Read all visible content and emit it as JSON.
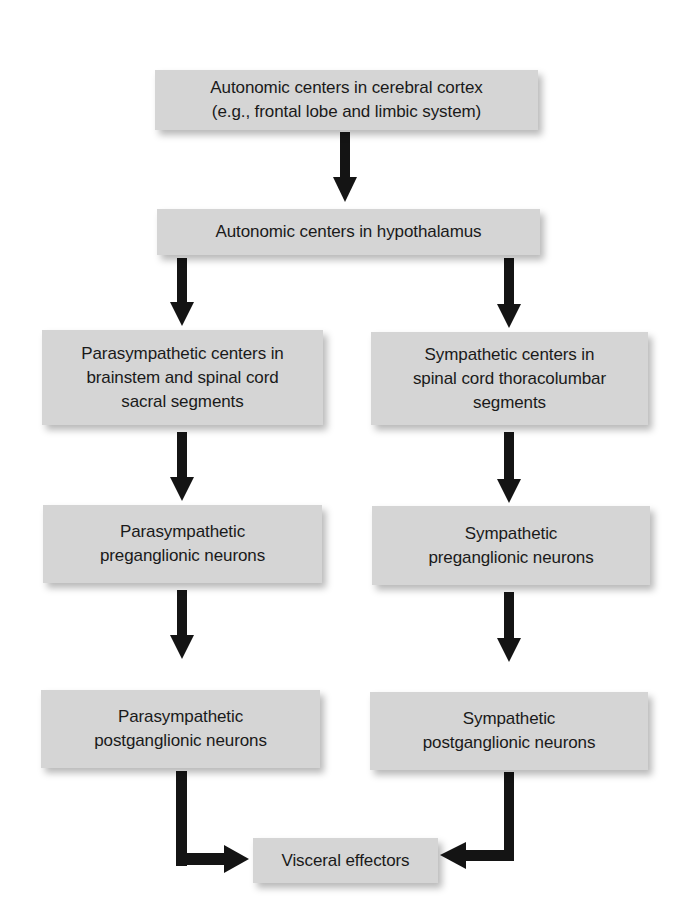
{
  "diagram": {
    "type": "flowchart",
    "title": "",
    "colors": {
      "box_fill": "#d5d5d5",
      "arrow": "#141414",
      "text": "#1a1a1a",
      "background": "#ffffff"
    },
    "nodes": {
      "cortex": {
        "lines": [
          "Autonomic centers in cerebral cortex",
          "(e.g., frontal lobe and limbic system)"
        ]
      },
      "hypothalamus": {
        "lines": [
          "Autonomic centers in hypothalamus"
        ]
      },
      "para_centers": {
        "lines": [
          "Parasympathetic centers in",
          "brainstem and spinal cord",
          "sacral segments"
        ]
      },
      "symp_centers": {
        "lines": [
          "Sympathetic centers in",
          "spinal cord thoracolumbar",
          "segments"
        ]
      },
      "para_pre": {
        "lines": [
          "Parasympathetic",
          "preganglionic neurons"
        ]
      },
      "symp_pre": {
        "lines": [
          "Sympathetic",
          "preganglionic neurons"
        ]
      },
      "para_post": {
        "lines": [
          "Parasympathetic",
          "postganglionic neurons"
        ]
      },
      "symp_post": {
        "lines": [
          "Sympathetic",
          "postganglionic neurons"
        ]
      },
      "effectors": {
        "lines": [
          "Visceral effectors"
        ]
      }
    },
    "edges": [
      {
        "from": "cortex",
        "to": "hypothalamus"
      },
      {
        "from": "hypothalamus",
        "to": "para_centers"
      },
      {
        "from": "hypothalamus",
        "to": "symp_centers"
      },
      {
        "from": "para_centers",
        "to": "para_pre"
      },
      {
        "from": "symp_centers",
        "to": "symp_pre"
      },
      {
        "from": "para_pre",
        "to": "para_post"
      },
      {
        "from": "symp_pre",
        "to": "symp_post"
      },
      {
        "from": "para_post",
        "to": "effectors"
      },
      {
        "from": "symp_post",
        "to": "effectors"
      }
    ]
  }
}
